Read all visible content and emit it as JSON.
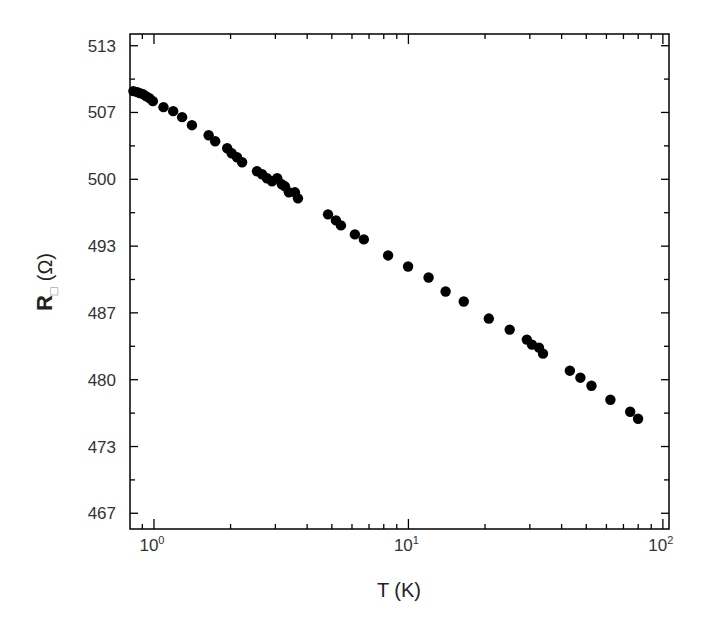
{
  "chart_data": {
    "type": "scatter",
    "title": "",
    "xlabel": "T (K)",
    "ylabel": "R□ (Ω)",
    "ylabel_main": "R",
    "ylabel_subscript": "□",
    "ylabel_unit": "(Ω)",
    "xscale": "log",
    "xlim": [
      0.805,
      105.7
    ],
    "ylim": [
      465.1,
      514.5
    ],
    "grid": false,
    "legend": null,
    "x_ticks": [
      {
        "value": 1,
        "label_base": "10",
        "label_exp": "0"
      },
      {
        "value": 10,
        "label_base": "10",
        "label_exp": "1"
      },
      {
        "value": 100,
        "label_base": "10",
        "label_exp": "2"
      }
    ],
    "y_ticks": [
      {
        "value": 513.33,
        "label": "513"
      },
      {
        "value": 506.67,
        "label": "507"
      },
      {
        "value": 500.0,
        "label": "500"
      },
      {
        "value": 493.33,
        "label": "493"
      },
      {
        "value": 486.67,
        "label": "487"
      },
      {
        "value": 480.0,
        "label": "480"
      },
      {
        "value": 473.33,
        "label": "473"
      },
      {
        "value": 466.67,
        "label": "467"
      }
    ],
    "series": [
      {
        "name": "R_sheet",
        "marker": "filled-circle",
        "color": "#000000",
        "x": [
          0.83,
          0.86,
          0.88,
          0.905,
          0.93,
          0.96,
          0.99,
          1.09,
          1.19,
          1.29,
          1.41,
          1.64,
          1.74,
          1.94,
          2.02,
          2.12,
          2.22,
          2.54,
          2.66,
          2.78,
          2.91,
          3.05,
          3.18,
          3.27,
          3.39,
          3.58,
          3.68,
          4.83,
          5.19,
          5.43,
          6.16,
          6.68,
          8.32,
          9.97,
          12.0,
          14.0,
          16.5,
          20.7,
          25.0,
          29.2,
          30.6,
          32.6,
          33.8,
          43.1,
          47.4,
          52.4,
          62.2,
          74.4,
          79.9
        ],
        "y": [
          508.8,
          508.7,
          508.6,
          508.5,
          508.3,
          508.1,
          507.8,
          507.2,
          506.8,
          506.2,
          505.4,
          504.4,
          503.8,
          503.1,
          502.6,
          502.2,
          501.7,
          500.8,
          500.5,
          500.1,
          499.8,
          500.1,
          499.5,
          499.3,
          498.7,
          498.7,
          498.1,
          496.5,
          495.9,
          495.4,
          494.5,
          494.0,
          492.4,
          491.3,
          490.2,
          488.8,
          487.8,
          486.1,
          485.0,
          484.0,
          483.5,
          483.2,
          482.6,
          480.9,
          480.2,
          479.4,
          478.0,
          476.8,
          476.1
        ]
      }
    ]
  }
}
